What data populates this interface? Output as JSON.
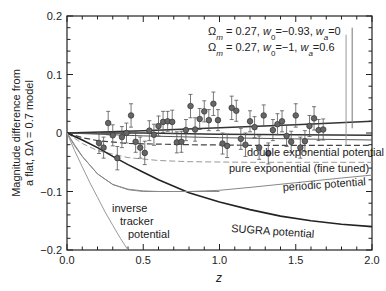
{
  "chart_data": {
    "type": "scatter",
    "title": "",
    "xlabel": "z",
    "ylabel_line1": "Magnitude difference from",
    "ylabel_line2": "a flat, ΩΛ = 0.7 model",
    "xlim": [
      0.0,
      2.0
    ],
    "ylim": [
      -0.2,
      0.2
    ],
    "xticks": [
      "0.0",
      "0.5",
      "1.0",
      "1.5",
      "2.0"
    ],
    "yticks": [
      "0.2",
      "0.1",
      "0",
      "−0.1",
      "−0.2"
    ],
    "grid": false,
    "legend": [
      {
        "label": "Ωm = 0.27, w0=−0.93, wa=0",
        "style": "dark solid"
      },
      {
        "label": "Ωm = 0.27, w0=−1, wa=0.6",
        "style": "gray solid"
      }
    ],
    "annotations": [
      {
        "text": "double exponential potential",
        "x": 1.85,
        "y": -0.035
      },
      {
        "text": "pure exponential (fine tuned)",
        "x": 1.85,
        "y": -0.058
      },
      {
        "text": "periodic potential",
        "x": 1.72,
        "y": -0.087
      },
      {
        "text": "SUGRA potential",
        "x": 1.35,
        "y": -0.158
      },
      {
        "text": "inverse",
        "x": 0.3,
        "y": -0.137
      },
      {
        "text": "tracker",
        "x": 0.35,
        "y": -0.161
      },
      {
        "text": "potential",
        "x": 0.42,
        "y": -0.184
      }
    ],
    "series": [
      {
        "name": "Ωm = 0.27, w0=−0.93, wa=0",
        "type": "line",
        "color": "#333333",
        "width": 1.4,
        "x": [
          0,
          0.5,
          1.0,
          1.5,
          2.0
        ],
        "y": [
          0,
          0.004,
          0.009,
          0.014,
          0.02
        ]
      },
      {
        "name": "Ωm = 0.27, w0=−1, wa=0.6",
        "type": "line",
        "color": "#333333",
        "width": 1.6,
        "x": [
          0,
          0.5,
          1.0,
          1.5,
          2.0
        ],
        "y": [
          0,
          0.0,
          -0.002,
          -0.003,
          -0.004
        ]
      },
      {
        "name": "flat line",
        "type": "line",
        "color": "#555555",
        "width": 1.0,
        "x": [
          0,
          0.5,
          1.0,
          1.5,
          2.0
        ],
        "y": [
          0,
          -0.005,
          -0.008,
          -0.01,
          -0.012
        ]
      },
      {
        "name": "double exponential potential",
        "type": "line",
        "dash": "6,3",
        "color": "#444444",
        "width": 1.2,
        "x": [
          0,
          0.1,
          0.2,
          0.4,
          0.8,
          1.2,
          1.6,
          2.0
        ],
        "y": [
          0,
          -0.008,
          -0.013,
          -0.018,
          -0.02,
          -0.021,
          -0.021,
          -0.021
        ]
      },
      {
        "name": "pure exponential (fine tuned)",
        "type": "line",
        "dash": "6,3",
        "color": "#999999",
        "width": 1.0,
        "x": [
          0,
          0.1,
          0.2,
          0.4,
          0.6,
          0.8,
          1.2,
          1.6,
          2.0
        ],
        "y": [
          0,
          -0.018,
          -0.03,
          -0.042,
          -0.047,
          -0.049,
          -0.05,
          -0.05,
          -0.05
        ]
      },
      {
        "name": "periodic potential",
        "type": "line",
        "color": "#888888",
        "width": 1.0,
        "x": [
          0,
          0.05,
          0.1,
          0.2,
          0.3,
          0.4,
          0.5,
          0.6,
          0.7,
          0.8,
          1.0,
          1.2,
          1.5,
          1.8,
          2.0
        ],
        "y": [
          0,
          -0.02,
          -0.04,
          -0.07,
          -0.088,
          -0.096,
          -0.099,
          -0.1,
          -0.1,
          -0.1,
          -0.098,
          -0.093,
          -0.085,
          -0.077,
          -0.072
        ]
      },
      {
        "name": "SUGRA potential",
        "type": "line",
        "color": "#222222",
        "width": 1.6,
        "x": [
          0,
          0.1,
          0.2,
          0.3,
          0.4,
          0.5,
          0.6,
          0.8,
          1.0,
          1.2,
          1.4,
          1.6,
          1.8,
          2.0
        ],
        "y": [
          0,
          -0.012,
          -0.025,
          -0.04,
          -0.054,
          -0.067,
          -0.08,
          -0.102,
          -0.118,
          -0.131,
          -0.142,
          -0.15,
          -0.156,
          -0.16
        ]
      },
      {
        "name": "inverse tracker (upper)",
        "type": "line",
        "color": "#888888",
        "width": 1.0,
        "x": [
          0,
          0.05,
          0.1,
          0.2,
          0.3,
          0.4,
          0.5,
          0.7,
          0.9,
          1.0
        ],
        "y": [
          0,
          -0.022,
          -0.04,
          -0.07,
          -0.088,
          -0.097,
          -0.1,
          -0.1,
          -0.1,
          -0.1
        ]
      },
      {
        "name": "inverse tracker potential",
        "type": "line",
        "color": "#999999",
        "width": 1.0,
        "x": [
          0,
          0.05,
          0.1,
          0.15,
          0.2,
          0.25,
          0.3,
          0.35,
          0.4
        ],
        "y": [
          0,
          -0.03,
          -0.058,
          -0.085,
          -0.11,
          -0.135,
          -0.158,
          -0.18,
          -0.2
        ]
      }
    ],
    "points": {
      "x": [
        0.21,
        0.24,
        0.27,
        0.3,
        0.33,
        0.36,
        0.39,
        0.42,
        0.45,
        0.48,
        0.51,
        0.54,
        0.57,
        0.6,
        0.63,
        0.66,
        0.69,
        0.72,
        0.75,
        0.78,
        0.81,
        0.84,
        0.87,
        0.9,
        0.93,
        0.96,
        0.99,
        1.02,
        1.05,
        1.08,
        1.11,
        1.14,
        1.17,
        1.2,
        1.23,
        1.26,
        1.29,
        1.32,
        1.35,
        1.38,
        1.41,
        1.44,
        1.47,
        1.5,
        1.53,
        1.56,
        1.59,
        1.62,
        1.65,
        1.68
      ],
      "y": [
        -0.017,
        -0.025,
        0.017,
        -0.004,
        -0.043,
        -0.007,
        0.0,
        0.03,
        -0.015,
        -0.025,
        -0.034,
        0.004,
        -0.003,
        0.012,
        0.019,
        0.02,
        0.019,
        -0.016,
        -0.015,
        0.005,
        0.046,
        0.006,
        0.024,
        0.037,
        0.022,
        0.05,
        0.022,
        -0.018,
        -0.022,
        0.043,
        0.038,
        -0.01,
        -0.02,
        0.02,
        0.01,
        -0.025,
        0.03,
        -0.035,
        0.005,
        0.015,
        0.02,
        -0.005,
        -0.015,
        0.03,
        -0.025,
        -0.014,
        0.012,
        0.025,
        0.005,
        0.006
      ],
      "err": [
        0.018,
        0.018,
        0.02,
        0.018,
        0.02,
        0.018,
        0.017,
        0.02,
        0.018,
        0.018,
        0.02,
        0.017,
        0.018,
        0.017,
        0.018,
        0.017,
        0.02,
        0.018,
        0.018,
        0.018,
        0.02,
        0.02,
        0.018,
        0.018,
        0.018,
        0.02,
        0.018,
        0.018,
        0.02,
        0.02,
        0.018,
        0.018,
        0.02,
        0.018,
        0.018,
        0.02,
        0.018,
        0.018,
        0.018,
        0.018,
        0.018,
        0.018,
        0.018,
        0.02,
        0.018,
        0.018,
        0.018,
        0.02,
        0.018,
        0.018
      ]
    },
    "legend_markers": [
      {
        "x": 1.87,
        "y_top": 0.18,
        "y_bottom": 0.008,
        "color": "#777777"
      },
      {
        "x": 1.83,
        "y_top": 0.168,
        "y_bottom": -0.022,
        "color": "#999999"
      }
    ]
  }
}
